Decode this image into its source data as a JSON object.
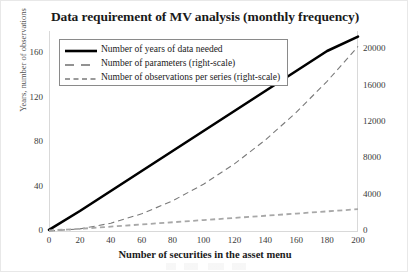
{
  "chart_data": {
    "type": "line",
    "title": "Data requirement of MV analysis (monthly frequency)",
    "xlabel": "Number of securities in the asset menu",
    "ylabel": "Years, number of observations",
    "ylabel_right": "",
    "grid": false,
    "legend_position": "top-left",
    "xlim": [
      0,
      200
    ],
    "ylim": [
      0,
      180
    ],
    "ylim_right": [
      0,
      22000
    ],
    "xticks": [
      0,
      20,
      40,
      60,
      80,
      100,
      120,
      140,
      160,
      180,
      200
    ],
    "yticks_left": [
      0,
      40,
      80,
      120,
      160
    ],
    "yticks_right": [
      0,
      4000,
      8000,
      12000,
      16000,
      20000
    ],
    "x": [
      0,
      20,
      40,
      60,
      80,
      100,
      120,
      140,
      160,
      180,
      200
    ],
    "series": [
      {
        "name": "Number of years of data needed",
        "axis": "left",
        "style": "solid",
        "color": "#000000",
        "width": 2.6,
        "values": [
          1,
          18,
          36,
          54,
          72,
          90,
          108,
          126,
          144,
          162,
          175
        ]
      },
      {
        "name": "Number of parameters (right-scale)",
        "axis": "right",
        "style": "dashed",
        "color": "#7a7a7a",
        "width": 1.1,
        "values": [
          0,
          230,
          860,
          1890,
          3320,
          5150,
          7380,
          10010,
          13040,
          16470,
          20300
        ]
      },
      {
        "name": "Number of observations per series (right-scale)",
        "axis": "right",
        "style": "dotted",
        "color": "#a8a8a8",
        "width": 1.8,
        "values": [
          60,
          240,
          480,
          720,
          960,
          1200,
          1440,
          1680,
          1920,
          2160,
          2400
        ]
      }
    ]
  },
  "legend": {
    "entries": [
      {
        "label": "Number of years of data needed"
      },
      {
        "label": "Number of parameters (right-scale)"
      },
      {
        "label": "Number of observations per series (right-scale)"
      }
    ]
  },
  "axis": {
    "left_ticks": [
      "160",
      "120",
      "80",
      "40",
      "0"
    ],
    "right_ticks": [
      "20000",
      "16000",
      "12000",
      "8000",
      "4000",
      "0"
    ],
    "x_ticks": [
      "0",
      "20",
      "40",
      "60",
      "80",
      "100",
      "120",
      "140",
      "160",
      "180",
      "200"
    ]
  }
}
